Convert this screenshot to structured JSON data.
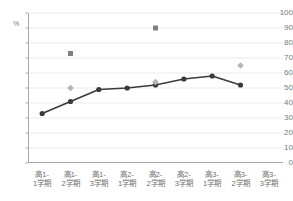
{
  "chart_data": {
    "type": "line",
    "title": "",
    "subtitle": "",
    "xlabel": "",
    "ylabel": "%",
    "ylim": [
      0,
      100
    ],
    "ytick_step": 10,
    "yticks": [
      "100",
      "90",
      "80",
      "70",
      "60",
      "50",
      "40",
      "30",
      "20",
      "10",
      "0"
    ],
    "unit_label": "%",
    "grid": true,
    "grid_axis": "y",
    "legend": "none",
    "categories": [
      "高1-1学期",
      "高1-2学期",
      "高1-3学期",
      "高2-1学期",
      "高2-2学期",
      "高2-3学期",
      "高3-1学期",
      "高3-2学期",
      "高3-3学期"
    ],
    "category_lines": [
      {
        "l1": "高1-",
        "l2": "1学期"
      },
      {
        "l1": "高1-",
        "l2": "2学期"
      },
      {
        "l1": "高1-",
        "l2": "3学期"
      },
      {
        "l1": "高2-",
        "l2": "1学期"
      },
      {
        "l1": "高2-",
        "l2": "2学期"
      },
      {
        "l1": "高2-",
        "l2": "3学期"
      },
      {
        "l1": "高3-",
        "l2": "1学期"
      },
      {
        "l1": "高3-",
        "l2": "2学期"
      },
      {
        "l1": "高3-",
        "l2": "3学期"
      }
    ],
    "series": [
      {
        "name": "line-series",
        "marker": "circle",
        "color": "#3a3a3a",
        "line": true,
        "values": [
          33,
          41,
          49,
          50,
          52,
          56,
          58,
          52,
          null
        ]
      },
      {
        "name": "square-series",
        "marker": "square",
        "color": "#808080",
        "line": false,
        "values": [
          null,
          73,
          null,
          null,
          90,
          null,
          null,
          null,
          null
        ]
      },
      {
        "name": "diamond-series",
        "marker": "diamond",
        "color": "#b5b5b5",
        "line": false,
        "values": [
          null,
          50,
          null,
          null,
          54,
          null,
          null,
          65,
          null
        ]
      }
    ]
  },
  "colors": {
    "axis": "#a8a8a8",
    "grid": "#ebebeb",
    "tick_text": "#7a7a7a",
    "category_text": "#6f6f6f",
    "line": "#3a3a3a",
    "square_marker": "#808080",
    "diamond_marker": "#b5b5b5",
    "background": "#ffffff"
  }
}
